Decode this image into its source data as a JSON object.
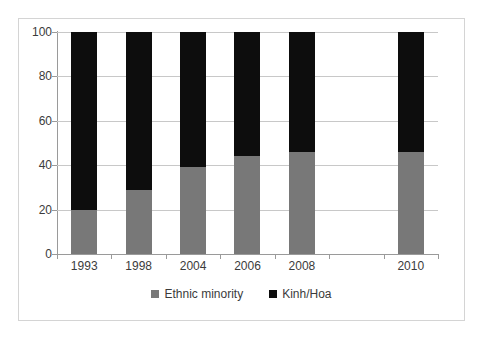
{
  "chart_data": {
    "type": "bar",
    "subtype": "stacked-100-percent",
    "title": "",
    "subtitle": "",
    "xlabel": "",
    "ylabel": "",
    "ylim": [
      0,
      100
    ],
    "yticks": [
      0,
      20,
      40,
      60,
      80,
      100
    ],
    "grid": true,
    "legend_position": "bottom",
    "categories": [
      "1993",
      "1998",
      "2004",
      "2006",
      "2008",
      "",
      "2010"
    ],
    "category_slots": 7,
    "empty_slot_index": 5,
    "series": [
      {
        "name": "Ethnic minority",
        "color": "#787878",
        "values": [
          20,
          29,
          39,
          44,
          46,
          null,
          46
        ]
      },
      {
        "name": "Kinh/Hoa",
        "color": "#0d0d0d",
        "values": [
          80,
          71,
          61,
          56,
          54,
          null,
          54
        ]
      }
    ]
  },
  "axes": {
    "y_tick_labels": [
      "0",
      "20",
      "40",
      "60",
      "80",
      "100"
    ],
    "x_tick_labels": [
      "1993",
      "1998",
      "2004",
      "2006",
      "2008",
      "",
      "2010"
    ]
  },
  "legend": {
    "items": [
      {
        "label": "Ethnic minority",
        "color": "#787878",
        "marker": "square-swatch-gray"
      },
      {
        "label": "Kinh/Hoa",
        "color": "#0d0d0d",
        "marker": "square-swatch-black"
      }
    ]
  },
  "colors": {
    "minority": "#787878",
    "kinh": "#0d0d0d",
    "gridline": "#c8c8c8",
    "axis": "#9a9a9a",
    "frame": "#d4d4d4",
    "text": "#3b3b3b",
    "background": "#ffffff"
  }
}
